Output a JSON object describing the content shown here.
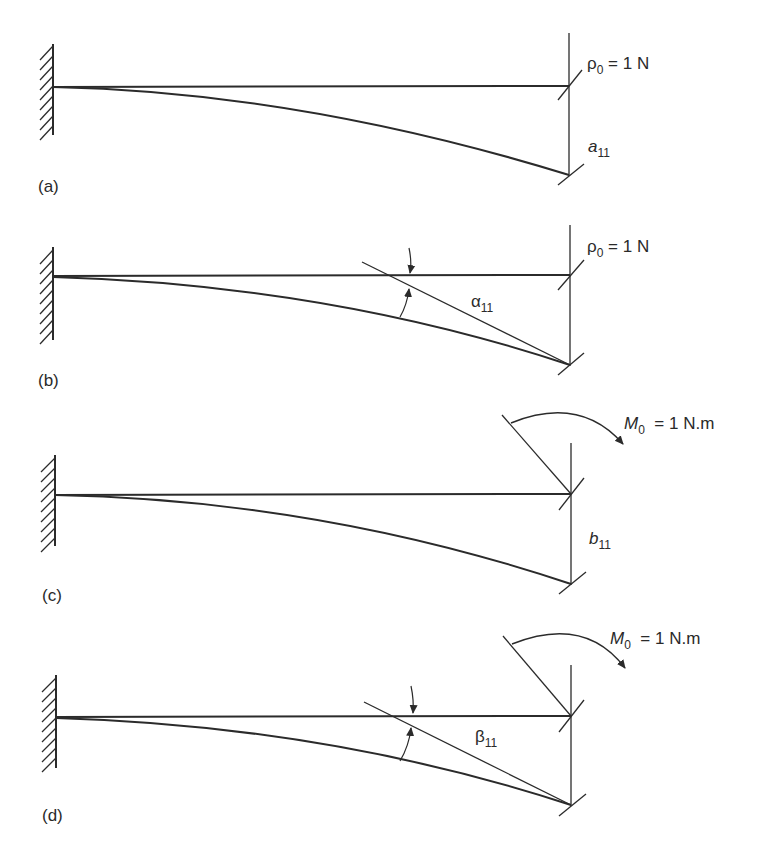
{
  "figure": {
    "panels": [
      {
        "id": "a",
        "label": "(a)",
        "load": {
          "symbol": "ρ",
          "subscript": "0",
          "value": " = 1 N"
        },
        "result": {
          "symbol": "a",
          "subscript": "11"
        }
      },
      {
        "id": "b",
        "label": "(b)",
        "load": {
          "symbol": "ρ",
          "subscript": "0",
          "value": " = 1 N"
        },
        "result": {
          "symbol": "α",
          "subscript": "11"
        }
      },
      {
        "id": "c",
        "label": "(c)",
        "load": {
          "symbol": "M",
          "subscript": "0",
          "value": "  = 1 N.m"
        },
        "result": {
          "symbol": "b",
          "subscript": "11"
        }
      },
      {
        "id": "d",
        "label": "(d)",
        "load": {
          "symbol": "M",
          "subscript": "0",
          "value": "  = 1 N.m"
        },
        "result": {
          "symbol": "β",
          "subscript": "11"
        }
      }
    ],
    "colors": {
      "line": "#2b2b2b",
      "background": "#ffffff"
    }
  }
}
